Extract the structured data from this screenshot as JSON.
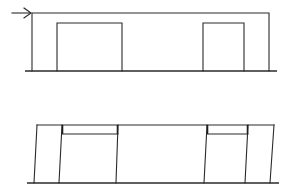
{
  "diagram": {
    "colors": {
      "line": "#2a2a2a",
      "background": "#ffffff"
    },
    "top_frame": {
      "load_arrow": {
        "x1": 12,
        "y1": 13,
        "x2": 31,
        "y2": 13,
        "direction": "right"
      },
      "ground": {
        "x1": 25,
        "x2": 277,
        "y": 71
      },
      "outer_frame": {
        "left": 32,
        "right": 269,
        "top": 13,
        "bottom": 71
      },
      "openings": [
        {
          "left": 57,
          "right": 122,
          "top": 23,
          "bottom": 71
        },
        {
          "left": 203,
          "right": 244,
          "top": 23,
          "bottom": 71
        }
      ]
    },
    "bottom_frame": {
      "ground": {
        "x1": 27,
        "x2": 279,
        "y": 183
      },
      "top_beam": {
        "x1": 37,
        "x2": 274,
        "y": 125
      },
      "columns": [
        {
          "xt": 37,
          "xb": 34
        },
        {
          "xt": 62,
          "xb": 59
        },
        {
          "xt": 118,
          "xb": 116
        },
        {
          "xt": 207,
          "xb": 204
        },
        {
          "xt": 248,
          "xb": 245
        },
        {
          "xt": 274,
          "xb": 270
        }
      ],
      "lintels": [
        {
          "left": 62,
          "right": 118,
          "top": 125,
          "bottom": 134
        },
        {
          "left": 207,
          "right": 248,
          "top": 125,
          "bottom": 134
        }
      ]
    }
  }
}
